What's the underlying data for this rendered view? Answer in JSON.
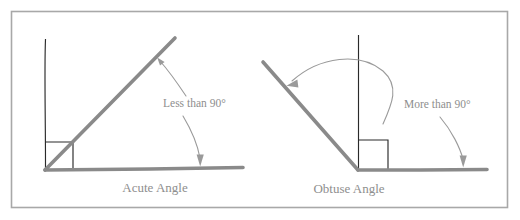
{
  "figure": {
    "canvas": {
      "width": 520,
      "height": 220,
      "background": "#ffffff"
    },
    "frame": {
      "color": "#a8a8a8",
      "x": 11,
      "y": 11,
      "width": 497,
      "height": 197
    },
    "colors": {
      "ray_gray": "#8a8a8a",
      "thin_black": "#2a2a2a",
      "leader_gray": "#9a9a9a",
      "text_gray": "#8e8e8e",
      "frame_gray": "#a8a8a8"
    }
  },
  "diagrams": [
    {
      "id": "acute",
      "caption": "Acute Angle",
      "annotation": "Less than 90°",
      "vertex": {
        "x": 45,
        "y": 170
      },
      "baseline": {
        "x1": 45,
        "y1": 170,
        "x2": 243,
        "y2": 168
      },
      "ray": {
        "x1": 45,
        "y1": 170,
        "x2": 175,
        "y2": 38
      },
      "vertical_line": {
        "x": 45,
        "y_top": 39,
        "y_bottom": 170
      },
      "right_angle_marker": {
        "size": 28,
        "orientation": "upper-right"
      },
      "caption_position": {
        "x": 155,
        "y": 192
      },
      "annotation_position": {
        "x": 163,
        "y": 107
      },
      "arrow_targets": [
        {
          "name": "ray-arrow",
          "x": 158,
          "y": 59
        },
        {
          "name": "baseline-arrow",
          "x": 200,
          "y": 166
        }
      ]
    },
    {
      "id": "obtuse",
      "caption": "Obtuse Angle",
      "annotation": "More than 90°",
      "vertex": {
        "x": 358,
        "y": 170
      },
      "baseline": {
        "x1": 358,
        "y1": 170,
        "x2": 487,
        "y2": 170
      },
      "ray": {
        "x1": 358,
        "y1": 170,
        "x2": 263,
        "y2": 62
      },
      "vertical_line": {
        "x": 358,
        "y_top": 35,
        "y_bottom": 170
      },
      "right_angle_marker": {
        "size": 30,
        "orientation": "upper-right"
      },
      "caption_position": {
        "x": 349,
        "y": 193
      },
      "annotation_position": {
        "x": 404,
        "y": 108
      },
      "arrow_targets": [
        {
          "name": "arc-arrow",
          "x": 287,
          "y": 85
        },
        {
          "name": "baseline-arrow",
          "x": 463,
          "y": 167
        }
      ]
    }
  ]
}
